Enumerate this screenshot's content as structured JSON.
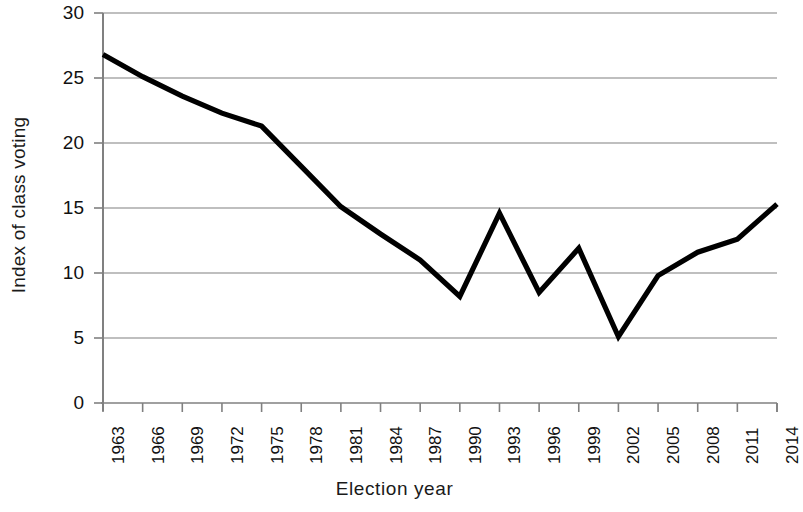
{
  "chart_data": {
    "type": "line",
    "title": "",
    "xlabel": "Election year",
    "ylabel": "Index of class voting",
    "x": [
      1963,
      1966,
      1969,
      1972,
      1975,
      1978,
      1981,
      1984,
      1987,
      1990,
      1993,
      1996,
      1999,
      2002,
      2005,
      2008,
      2011,
      2014
    ],
    "categories": [
      "1963",
      "1966",
      "1969",
      "1972",
      "1975",
      "1978",
      "1981",
      "1984",
      "1987",
      "1990",
      "1993",
      "1996",
      "1999",
      "2002",
      "2005",
      "2008",
      "2011",
      "2014"
    ],
    "values": [
      26.8,
      25.1,
      23.6,
      22.3,
      21.3,
      18.2,
      15.1,
      13.0,
      11.0,
      8.2,
      14.6,
      8.5,
      11.9,
      5.1,
      9.8,
      11.6,
      12.6,
      15.3
    ],
    "series": [
      {
        "name": "Index of class voting",
        "values": [
          26.8,
          25.1,
          23.6,
          22.3,
          21.3,
          18.2,
          15.1,
          13.0,
          11.0,
          8.2,
          14.6,
          8.5,
          11.9,
          5.1,
          9.8,
          11.6,
          12.6,
          15.3
        ]
      }
    ],
    "ylim": [
      0,
      30
    ],
    "yticks": [
      0,
      5,
      10,
      15,
      20,
      25,
      30
    ],
    "ytick_labels": [
      "0",
      "5",
      "10",
      "15",
      "20",
      "25",
      "30"
    ],
    "xlim": [
      1963,
      2014
    ],
    "grid": "horizontal",
    "legend": "none",
    "line_color": "#000000",
    "grid_color": "#808080",
    "axis_color": "#808080",
    "background": "#ffffff"
  }
}
